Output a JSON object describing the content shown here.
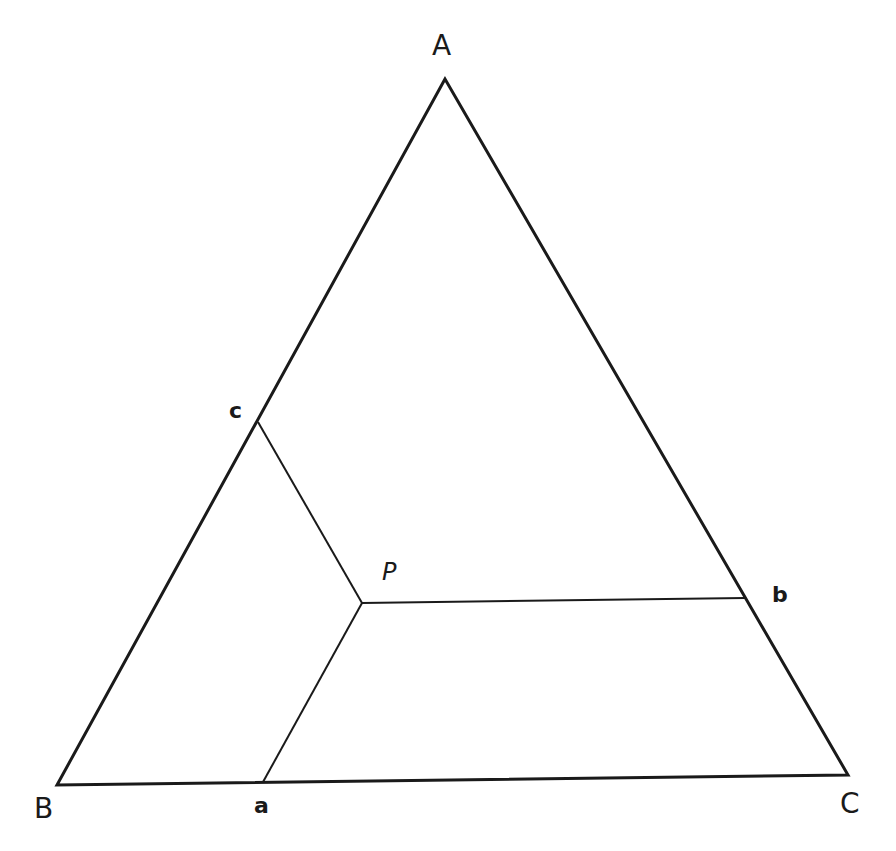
{
  "diagram": {
    "type": "ternary-point-construction",
    "stroke_color": "#1a1a1a",
    "background": "#ffffff",
    "vertices": {
      "A": {
        "label": "A",
        "x": 445,
        "y": 79
      },
      "B": {
        "label": "B",
        "x": 57,
        "y": 785
      },
      "C": {
        "label": "C",
        "x": 848,
        "y": 775
      }
    },
    "side_points": {
      "a": {
        "label": "a",
        "x": 263,
        "y": 782
      },
      "b": {
        "label": "b",
        "x": 745,
        "y": 598
      },
      "c": {
        "label": "c",
        "x": 258,
        "y": 422
      }
    },
    "interior_point": {
      "label": "P",
      "x": 362,
      "y": 603
    },
    "segments": [
      {
        "from": "P",
        "to": "a"
      },
      {
        "from": "P",
        "to": "b"
      },
      {
        "from": "P",
        "to": "c"
      }
    ]
  }
}
